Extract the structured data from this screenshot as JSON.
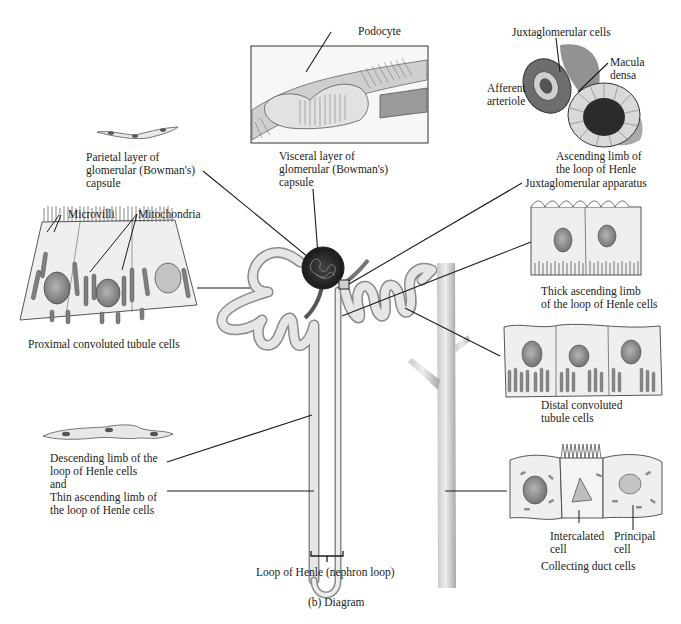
{
  "figure": {
    "caption": "(b) Diagram"
  },
  "labels": {
    "podocyte": "Podocyte",
    "visceral_layer": [
      "Visceral layer of",
      "glomerular (Bowman's)",
      "capsule"
    ],
    "parietal_layer": [
      "Parietal layer of",
      "glomerular (Bowman's)",
      "capsule"
    ],
    "juxtaglomerular_cells": "Juxtaglomerular cells",
    "macula_densa": [
      "Macula",
      "densa"
    ],
    "afferent_arteriole": [
      "Afferent",
      "arteriole"
    ],
    "ascending_limb": [
      "Ascending limb of",
      "the loop of Henle"
    ],
    "juxtaglomerular_apparatus": "Juxtaglomerular apparatus",
    "microvilli": "Microvilli",
    "mitochondria": "Mitochondria",
    "proximal_cells": "Proximal convoluted tubule cells",
    "thick_ascending": [
      "Thick ascending limb",
      "of the loop of Henle cells"
    ],
    "distal_cells": [
      "Distal convoluted",
      "tubule cells"
    ],
    "descending_thin": [
      "Descending limb of the",
      "loop of Henle cells",
      "and",
      "Thin ascending limb of",
      "the loop of Henle cells"
    ],
    "intercalated_cell": [
      "Intercalated",
      "cell"
    ],
    "principal_cell": [
      "Principal",
      "cell"
    ],
    "collecting_duct_cells": "Collecting duct cells",
    "loop_of_henle": "Loop of Henle (nephron loop)"
  },
  "colors": {
    "ink": "#1b1b1b",
    "tubule_fill": "#e4e4e4",
    "tubule_stroke": "#8a8a8a",
    "cell_fill": "#f1f1f1",
    "nucleus": "#8c8c8c",
    "glomerulus": "#2a2a2a"
  }
}
